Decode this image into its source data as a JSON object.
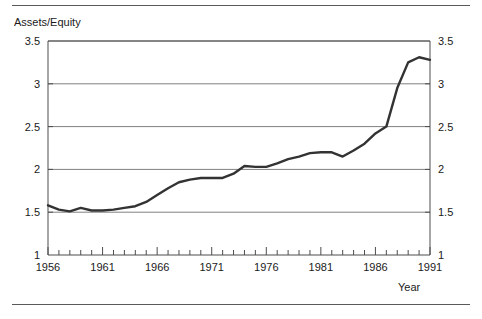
{
  "figure": {
    "top_rule": "horizontal-rule",
    "bottom_rule": "horizontal-rule"
  },
  "axis_titles": {
    "y": "Assets/Equity",
    "x": "Year"
  },
  "chart_data": {
    "type": "line",
    "title": "",
    "subtitle": "",
    "xlabel": "Year",
    "ylabel": "Assets/Equity",
    "xlim": [
      1956,
      1991
    ],
    "ylim": [
      1,
      3.5
    ],
    "grid": true,
    "grid_axis": "y",
    "legend": false,
    "legend_position": "none",
    "line_color": "#333333",
    "line_width": 2.4,
    "y_ticks": [
      1,
      1.5,
      2,
      2.5,
      3,
      3.5
    ],
    "y_tick_labels": [
      "1",
      "1.5",
      "2",
      "2.5",
      "3",
      "3.5"
    ],
    "y_axis_mirrored": true,
    "x_ticks": [
      1956,
      1957,
      1958,
      1959,
      1960,
      1961,
      1962,
      1963,
      1964,
      1965,
      1966,
      1967,
      1968,
      1969,
      1970,
      1971,
      1972,
      1973,
      1974,
      1975,
      1976,
      1977,
      1978,
      1979,
      1980,
      1981,
      1982,
      1983,
      1984,
      1985,
      1986,
      1987,
      1988,
      1989,
      1990,
      1991
    ],
    "x_tick_labels_major": [
      "1956",
      "1961",
      "1966",
      "1971",
      "1976",
      "1981",
      "1986",
      "1991"
    ],
    "x_major_years": [
      1956,
      1961,
      1966,
      1971,
      1976,
      1981,
      1986,
      1991
    ],
    "series": [
      {
        "name": "Assets/Equity",
        "x": [
          1956,
          1957,
          1958,
          1959,
          1960,
          1961,
          1962,
          1963,
          1964,
          1965,
          1966,
          1967,
          1968,
          1969,
          1970,
          1971,
          1972,
          1973,
          1974,
          1975,
          1976,
          1977,
          1978,
          1979,
          1980,
          1981,
          1982,
          1983,
          1984,
          1985,
          1986,
          1987,
          1988,
          1989,
          1990,
          1991
        ],
        "values": [
          1.58,
          1.53,
          1.51,
          1.55,
          1.52,
          1.52,
          1.53,
          1.55,
          1.57,
          1.62,
          1.7,
          1.78,
          1.85,
          1.88,
          1.9,
          1.9,
          1.9,
          1.95,
          2.04,
          2.03,
          2.03,
          2.07,
          2.12,
          2.15,
          2.19,
          2.2,
          2.2,
          2.15,
          2.22,
          2.3,
          2.42,
          2.5,
          2.95,
          3.25,
          3.31,
          3.28
        ]
      }
    ]
  }
}
